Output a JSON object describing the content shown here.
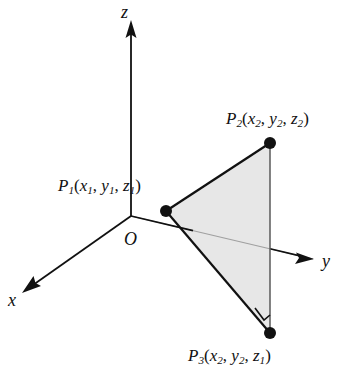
{
  "figure": {
    "background_color": "#ffffff",
    "line_color": "#111111",
    "fill_color": "#e6e6e6",
    "hidden_line_color": "#9a9a9a"
  },
  "axes": {
    "x": {
      "label": "x",
      "arrow": "down-left",
      "origin": [
        131,
        216
      ],
      "tip": [
        23,
        292
      ]
    },
    "y": {
      "label": "y",
      "arrow": "right",
      "origin": [
        131,
        216
      ],
      "tip": [
        313,
        259
      ]
    },
    "z": {
      "label": "z",
      "arrow": "up",
      "origin": [
        131,
        216
      ],
      "tip": [
        131,
        22
      ]
    },
    "origin_label": "O"
  },
  "points": [
    {
      "id": "P1",
      "label_prefix": "P",
      "label_sub": "1",
      "coords": [
        "x",
        "1",
        "y",
        "1",
        "z",
        "1"
      ],
      "label_text": "P1(x1, y1, z1)",
      "position": [
        166,
        211
      ]
    },
    {
      "id": "P2",
      "label_prefix": "P",
      "label_sub": "2",
      "coords": [
        "x",
        "2",
        "y",
        "2",
        "z",
        "2"
      ],
      "label_text": "P2(x2, y2, z2)",
      "position": [
        270,
        143
      ]
    },
    {
      "id": "P3",
      "label_prefix": "P",
      "label_sub": "3",
      "coords": [
        "x",
        "2",
        "y",
        "2",
        "z",
        "1"
      ],
      "label_text": "P3(x2, y2, z1)",
      "position": [
        270,
        333
      ]
    }
  ],
  "triangle": {
    "vertices": [
      [
        166,
        211
      ],
      [
        270,
        143
      ],
      [
        270,
        333
      ]
    ],
    "right_angle_at": "P3",
    "right_angle_marker": true
  }
}
